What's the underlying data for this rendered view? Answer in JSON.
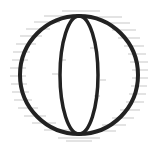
{
  "icon": {
    "name": "globe-icon",
    "stroke_color": "#222222",
    "hatch_color": "#9a9a9a",
    "background": "#ffffff"
  }
}
